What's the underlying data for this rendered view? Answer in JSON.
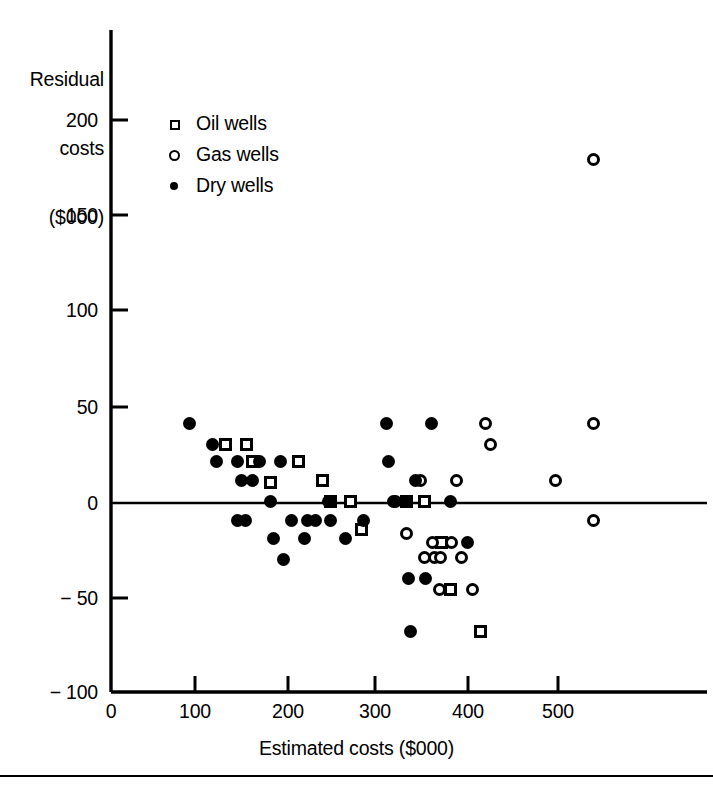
{
  "chart_data": {
    "type": "scatter",
    "title": "",
    "ylabel": "Residual\ncosts\n($000)",
    "ylabel_lines": [
      "Residual",
      "costs",
      "($000)"
    ],
    "xlabel": "Estimated costs ($000)",
    "xlim": [
      0,
      550
    ],
    "ylim": [
      -100,
      215
    ],
    "grid": false,
    "zero_line": true,
    "xticks": [
      0,
      100,
      200,
      300,
      400,
      500
    ],
    "xtick_labels": [
      "0",
      "100",
      "200",
      "300",
      "400",
      "500"
    ],
    "yticks": [
      -100,
      -50,
      0,
      50,
      100,
      150,
      200
    ],
    "ytick_labels": [
      "− 100",
      "− 50",
      "0",
      "50",
      "100",
      "150",
      "200"
    ],
    "legend_position": "upper-left-inside",
    "series": [
      {
        "name": "Oil wells",
        "marker": "open-square",
        "color": "#000000",
        "points": [
          [
            128,
            31
          ],
          [
            152,
            31
          ],
          [
            158,
            22
          ],
          [
            178,
            11
          ],
          [
            210,
            22
          ],
          [
            237,
            12
          ],
          [
            246,
            1
          ],
          [
            268,
            1
          ],
          [
            280,
            -14
          ],
          [
            330,
            1
          ],
          [
            351,
            1
          ],
          [
            370,
            -21
          ],
          [
            380,
            -46
          ],
          [
            413,
            -68
          ]
        ]
      },
      {
        "name": "Gas wells",
        "marker": "open-circle",
        "color": "#000000",
        "points": [
          [
            316,
            1
          ],
          [
            330,
            -16
          ],
          [
            346,
            12
          ],
          [
            351,
            -29
          ],
          [
            360,
            -21
          ],
          [
            362,
            -29
          ],
          [
            369,
            -29
          ],
          [
            367,
            -46
          ],
          [
            381,
            -21
          ],
          [
            387,
            12
          ],
          [
            392,
            -29
          ],
          [
            404,
            -46
          ],
          [
            419,
            42
          ],
          [
            424,
            31
          ],
          [
            497,
            12
          ],
          [
            540,
            182
          ],
          [
            540,
            42
          ],
          [
            540,
            -9
          ]
        ]
      },
      {
        "name": "Dry wells",
        "marker": "filled-circle",
        "color": "#000000",
        "points": [
          [
            88,
            42
          ],
          [
            114,
            31
          ],
          [
            118,
            22
          ],
          [
            141,
            22
          ],
          [
            146,
            12
          ],
          [
            158,
            12
          ],
          [
            166,
            22
          ],
          [
            141,
            -9
          ],
          [
            150,
            -9
          ],
          [
            178,
            1
          ],
          [
            182,
            -19
          ],
          [
            190,
            22
          ],
          [
            193,
            -30
          ],
          [
            202,
            -9
          ],
          [
            216,
            -19
          ],
          [
            220,
            -9
          ],
          [
            229,
            -9
          ],
          [
            243,
            1
          ],
          [
            246,
            -9
          ],
          [
            262,
            -19
          ],
          [
            282,
            -9
          ],
          [
            308,
            42
          ],
          [
            318,
            1
          ],
          [
            310,
            22
          ],
          [
            330,
            1
          ],
          [
            333,
            -40
          ],
          [
            335,
            -68
          ],
          [
            341,
            12
          ],
          [
            352,
            -40
          ],
          [
            358,
            42
          ],
          [
            380,
            1
          ],
          [
            399,
            -21
          ]
        ]
      }
    ]
  },
  "legend": {
    "items": [
      {
        "marker": "open-square",
        "label": "Oil wells"
      },
      {
        "marker": "open-circle",
        "label": "Gas wells"
      },
      {
        "marker": "filled-circle",
        "label": "Dry wells"
      }
    ]
  },
  "colors": {
    "ink": "#000000",
    "background": "#ffffff"
  }
}
